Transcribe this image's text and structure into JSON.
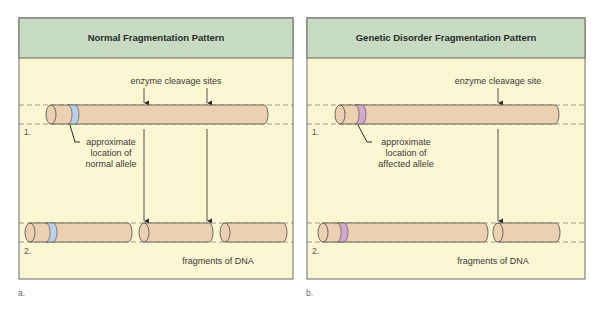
{
  "colors": {
    "header_bg": "#c7dcc2",
    "panel_bg": "#fbf7d2",
    "border": "#6b6b62",
    "dna": "#ecd0b2",
    "normal_allele": "#b8d0ea",
    "affected_allele": "#cfa9cf"
  },
  "panels": [
    {
      "caption": "a.",
      "title": "Normal Fragmentation Pattern",
      "cleavage_label": "enzyme cleavage sites",
      "allele_label": [
        "approximate",
        "location of",
        "normal allele"
      ],
      "row1_label": "1.",
      "row2_label": "2.",
      "fragments_label": "fragments of DNA"
    },
    {
      "caption": "b.",
      "title": "Genetic Disorder Fragmentation Pattern",
      "cleavage_label": "enzyme cleavage site",
      "allele_label": [
        "approximate",
        "location of",
        "affected allele"
      ],
      "row1_label": "1.",
      "row2_label": "2.",
      "fragments_label": "fragments of DNA"
    }
  ]
}
